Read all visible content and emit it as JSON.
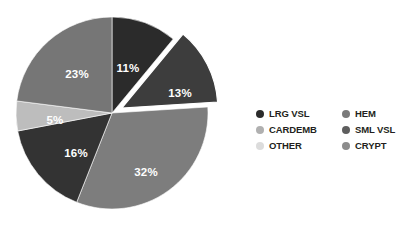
{
  "chart_data": {
    "type": "pie",
    "title": "",
    "subtitle": "",
    "xlabel": "",
    "ylabel": "",
    "grid": false,
    "legend_position": "right",
    "background_color": "#ffffff",
    "label_color": "#ffffff",
    "total": 100,
    "units": "%",
    "categories": [
      "LRG VSL",
      "HEM",
      "SML VSL",
      "CRYPT",
      "OTHER",
      "CARDEMB"
    ],
    "values": [
      11,
      13,
      32,
      16,
      5,
      23
    ],
    "slices": [
      {
        "name": "LRG VSL",
        "value": 11,
        "label": "11%",
        "color": "#2b2b2b",
        "start_angle": 0,
        "end_angle": 39.6,
        "exploded": false,
        "label_x": 128,
        "label_y": 72
      },
      {
        "name": "HEM",
        "value": 13,
        "label": "13%",
        "color": "#3d3d3d",
        "start_angle": 39.6,
        "end_angle": 86.4,
        "exploded": true,
        "label_x": 180,
        "label_y": 97
      },
      {
        "name": "SML VSL",
        "value": 32,
        "label": "32%",
        "color": "#7d7d7d",
        "start_angle": 86.4,
        "end_angle": 201.6,
        "exploded": false,
        "label_x": 146,
        "label_y": 176
      },
      {
        "name": "CRYPT",
        "value": 16,
        "label": "16%",
        "color": "#333333",
        "start_angle": 201.6,
        "end_angle": 259.2,
        "exploded": false,
        "label_x": 76,
        "label_y": 157
      },
      {
        "name": "OTHER",
        "value": 5,
        "label": "5%",
        "color": "#bdbdbd",
        "start_angle": 259.2,
        "end_angle": 277.2,
        "exploded": false,
        "label_x": 55,
        "label_y": 124
      },
      {
        "name": "CARDEMB",
        "value": 23,
        "label": "23%",
        "color": "#767676",
        "start_angle": 277.2,
        "end_angle": 360,
        "exploded": false,
        "label_x": 77,
        "label_y": 78
      }
    ],
    "legend": {
      "columns": [
        {
          "items": [
            {
              "label": "LRG VSL",
              "color": "#2b2b2b"
            },
            {
              "label": "CARDEMB",
              "color": "#b0b0b0"
            },
            {
              "label": "OTHER",
              "color": "#dcdcdc"
            }
          ]
        },
        {
          "items": [
            {
              "label": "HEM",
              "color": "#7a7a7a"
            },
            {
              "label": "SML VSL",
              "color": "#5e5e5e"
            },
            {
              "label": "CRYPT",
              "color": "#8c8c8c"
            }
          ]
        }
      ]
    }
  }
}
